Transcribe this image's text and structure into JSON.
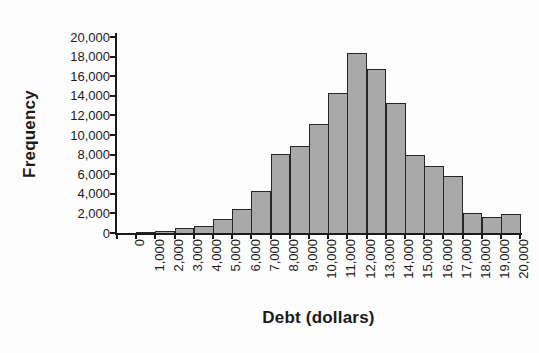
{
  "chart_data": {
    "type": "bar",
    "title": "",
    "xlabel": "Debt (dollars)",
    "ylabel": "Frequency",
    "categories": [
      "0",
      "1,000",
      "2,000",
      "3,000",
      "4,000",
      "5,000",
      "6,000",
      "7,000",
      "8,000",
      "9,000",
      "10,000",
      "11,000",
      "12,000",
      "13,000",
      "14,000",
      "15,000",
      "16,000",
      "17,000",
      "18,000",
      "19,000",
      "20,000"
    ],
    "values": [
      0,
      100,
      200,
      500,
      700,
      1400,
      2400,
      4300,
      8100,
      8900,
      11100,
      14300,
      18400,
      16700,
      13300,
      8000,
      6800,
      5800,
      2000,
      1600,
      1900
    ],
    "ylim": [
      0,
      20000
    ],
    "ytick_step": 2000,
    "ytick_labels": [
      "0",
      "2,000",
      "4,000",
      "6,000",
      "8,000",
      "10,000",
      "12,000",
      "14,000",
      "16,000",
      "18,000",
      "20,000"
    ],
    "grid": false,
    "legend": false,
    "bar_fill": "#a9a9a9",
    "bar_border": "#262626",
    "axis_color": "#1b1b1b"
  }
}
